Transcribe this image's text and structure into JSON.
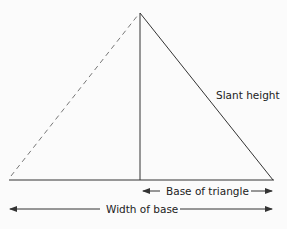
{
  "diagram": {
    "type": "pyramid cross-section triangle",
    "labels": {
      "slant_height": "Slant height",
      "base_of_triangle": "Base of triangle",
      "width_of_base": "Width of base"
    },
    "colors": {
      "line": "#333333",
      "dashed_line": "#777777",
      "text": "#222222",
      "background": "#fbfbfb"
    }
  }
}
